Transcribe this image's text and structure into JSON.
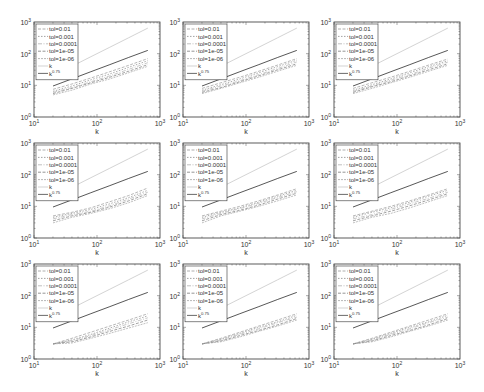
{
  "figure": {
    "layout": {
      "rows": 3,
      "cols": 3
    },
    "colors": {
      "axis": "#333333",
      "legend_border": "#333333",
      "k_line": "#c8c8c8",
      "k075_line": "#444444",
      "tol_lines": [
        "#9a9a9a",
        "#8a8a8a",
        "#b0b0b0",
        "#7a7a7a",
        "#a5a5a5"
      ]
    }
  },
  "chart_data": [
    {
      "type": "line",
      "panel": "row1-col1",
      "xscale": "log",
      "yscale": "log",
      "xlim": [
        10,
        1000
      ],
      "ylim": [
        1,
        1000
      ],
      "xlabel": "k",
      "ylabel": "",
      "xticks": [
        "10^1",
        "10^2",
        "10^3"
      ],
      "yticks": [
        "10^0",
        "10^1",
        "10^2",
        "10^3"
      ],
      "x": [
        20,
        40,
        80,
        160,
        320,
        640
      ],
      "legend": [
        "tol=0.01",
        "tol=0.001",
        "tol=0.0001",
        "tol=1e-05",
        "tol=1e-06",
        "k",
        "k^{0.75}"
      ],
      "legend_position": "upper left",
      "series": [
        {
          "name": "tol=0.01",
          "values": [
            7.5,
            11,
            17,
            27,
            43,
            70
          ]
        },
        {
          "name": "tol=0.001",
          "values": [
            6.5,
            9.5,
            15,
            23,
            37,
            60
          ]
        },
        {
          "name": "tol=0.0001",
          "values": [
            6,
            8.5,
            13,
            20,
            32,
            52
          ]
        },
        {
          "name": "tol=1e-05",
          "values": [
            5.5,
            8,
            12,
            18,
            28,
            45
          ]
        },
        {
          "name": "tol=1e-06",
          "values": [
            5,
            7,
            11,
            16,
            25,
            40
          ]
        },
        {
          "name": "k",
          "values": [
            20,
            40,
            80,
            160,
            320,
            640
          ]
        },
        {
          "name": "k^{0.75}",
          "values": [
            9.5,
            16,
            27,
            45,
            76,
            127
          ]
        }
      ]
    },
    {
      "type": "line",
      "panel": "row1-col2",
      "xscale": "log",
      "yscale": "log",
      "xlim": [
        10,
        1000
      ],
      "ylim": [
        1,
        1000
      ],
      "xlabel": "k",
      "ylabel": "",
      "xticks": [
        "10^1",
        "10^2",
        "10^3"
      ],
      "yticks": [
        "10^0",
        "10^1",
        "10^2",
        "10^3"
      ],
      "x": [
        20,
        40,
        80,
        160,
        320,
        640
      ],
      "legend": [
        "tol=0.01",
        "tol=0.001",
        "tol=0.0001",
        "tol=1e-05",
        "tol=1e-06",
        "k",
        "k^{0.75}"
      ],
      "legend_position": "upper left",
      "series": [
        {
          "name": "tol=0.01",
          "values": [
            8,
            12,
            18,
            28,
            44,
            70
          ]
        },
        {
          "name": "tol=0.001",
          "values": [
            7,
            10.5,
            16,
            25,
            39,
            62
          ]
        },
        {
          "name": "tol=0.0001",
          "values": [
            6.5,
            9.5,
            14,
            22,
            34,
            55
          ]
        },
        {
          "name": "tol=1e-05",
          "values": [
            6,
            8.5,
            13,
            20,
            31,
            48
          ]
        },
        {
          "name": "tol=1e-06",
          "values": [
            5.5,
            8,
            12,
            18,
            28,
            43
          ]
        },
        {
          "name": "k",
          "values": [
            20,
            40,
            80,
            160,
            320,
            640
          ]
        },
        {
          "name": "k^{0.75}",
          "values": [
            9.5,
            16,
            27,
            45,
            76,
            127
          ]
        }
      ]
    },
    {
      "type": "line",
      "panel": "row1-col3",
      "xscale": "log",
      "yscale": "log",
      "xlim": [
        10,
        1000
      ],
      "ylim": [
        1,
        1000
      ],
      "xlabel": "k",
      "ylabel": "",
      "xticks": [
        "10^1",
        "10^2",
        "10^3"
      ],
      "yticks": [
        "10^0",
        "10^1",
        "10^2",
        "10^3"
      ],
      "x": [
        20,
        40,
        80,
        160,
        320,
        640
      ],
      "legend": [
        "tol=0.01",
        "tol=0.001",
        "tol=0.0001",
        "tol=1e-05",
        "tol=1e-06",
        "k",
        "k^{0.75}"
      ],
      "legend_position": "upper left",
      "series": [
        {
          "name": "tol=0.01",
          "values": [
            8,
            12,
            18,
            28,
            44,
            68
          ]
        },
        {
          "name": "tol=0.001",
          "values": [
            7,
            10.5,
            16,
            25,
            39,
            60
          ]
        },
        {
          "name": "tol=0.0001",
          "values": [
            6.5,
            9.5,
            14.5,
            22,
            35,
            54
          ]
        },
        {
          "name": "tol=1e-05",
          "values": [
            6,
            9,
            13,
            20,
            31,
            48
          ]
        },
        {
          "name": "tol=1e-06",
          "values": [
            5.5,
            8,
            12,
            18,
            28,
            43
          ]
        },
        {
          "name": "k",
          "values": [
            20,
            40,
            80,
            160,
            320,
            640
          ]
        },
        {
          "name": "k^{0.75}",
          "values": [
            9.5,
            16,
            27,
            45,
            76,
            127
          ]
        }
      ]
    },
    {
      "type": "line",
      "panel": "row2-col1",
      "xscale": "log",
      "yscale": "log",
      "xlim": [
        10,
        1000
      ],
      "ylim": [
        1,
        1000
      ],
      "xlabel": "k",
      "ylabel": "",
      "xticks": [
        "10^1",
        "10^2",
        "10^3"
      ],
      "yticks": [
        "10^0",
        "10^1",
        "10^2",
        "10^3"
      ],
      "x": [
        20,
        40,
        80,
        160,
        320,
        640
      ],
      "legend": [
        "tol=0.01",
        "tol=0.001",
        "tol=0.0001",
        "tol=1e-05",
        "tol=1e-06",
        "k",
        "k^{0.75}"
      ],
      "legend_position": "upper left",
      "series": [
        {
          "name": "tol=0.01",
          "values": [
            5,
            6.5,
            9,
            14,
            22,
            38
          ]
        },
        {
          "name": "tol=0.001",
          "values": [
            4.5,
            6,
            8,
            12,
            19,
            32
          ]
        },
        {
          "name": "tol=0.0001",
          "values": [
            4,
            5.5,
            7,
            10.5,
            17,
            28
          ]
        },
        {
          "name": "tol=1e-05",
          "values": [
            3.5,
            5,
            6.5,
            9.5,
            15,
            25
          ]
        },
        {
          "name": "tol=1e-06",
          "values": [
            3,
            4.5,
            6,
            8.5,
            13,
            22
          ]
        },
        {
          "name": "k",
          "values": [
            20,
            40,
            80,
            160,
            320,
            640
          ]
        },
        {
          "name": "k^{0.75}",
          "values": [
            9.5,
            16,
            27,
            45,
            76,
            127
          ]
        }
      ]
    },
    {
      "type": "line",
      "panel": "row2-col2",
      "xscale": "log",
      "yscale": "log",
      "xlim": [
        10,
        1000
      ],
      "ylim": [
        1,
        1000
      ],
      "xlabel": "k",
      "ylabel": "",
      "xticks": [
        "10^1",
        "10^2",
        "10^3"
      ],
      "yticks": [
        "10^0",
        "10^1",
        "10^2",
        "10^3"
      ],
      "x": [
        20,
        40,
        80,
        160,
        320,
        640
      ],
      "legend": [
        "tol=0.01",
        "tol=0.001",
        "tol=0.0001",
        "tol=1e-05",
        "tol=1e-06",
        "k",
        "k^{0.75}"
      ],
      "legend_position": "upper left",
      "series": [
        {
          "name": "tol=0.01",
          "values": [
            5,
            7,
            10,
            15,
            23,
            36
          ]
        },
        {
          "name": "tol=0.001",
          "values": [
            4.5,
            6.5,
            9,
            13.5,
            21,
            32
          ]
        },
        {
          "name": "tol=0.0001",
          "values": [
            4,
            6,
            8.5,
            12.5,
            19,
            29
          ]
        },
        {
          "name": "tol=1e-05",
          "values": [
            3.5,
            5.5,
            7.5,
            11,
            17,
            26
          ]
        },
        {
          "name": "tol=1e-06",
          "values": [
            3,
            5,
            7,
            10,
            15,
            23
          ]
        },
        {
          "name": "k",
          "values": [
            20,
            40,
            80,
            160,
            320,
            640
          ]
        },
        {
          "name": "k^{0.75}",
          "values": [
            9.5,
            16,
            27,
            45,
            76,
            127
          ]
        }
      ]
    },
    {
      "type": "line",
      "panel": "row2-col3",
      "xscale": "log",
      "yscale": "log",
      "xlim": [
        10,
        1000
      ],
      "ylim": [
        1,
        1000
      ],
      "xlabel": "k",
      "ylabel": "",
      "xticks": [
        "10^1",
        "10^2",
        "10^3"
      ],
      "yticks": [
        "10^0",
        "10^1",
        "10^2",
        "10^3"
      ],
      "x": [
        20,
        40,
        80,
        160,
        320,
        640
      ],
      "legend": [
        "tol=0.01",
        "tol=0.001",
        "tol=0.0001",
        "tol=1e-05",
        "tol=1e-06",
        "k",
        "k^{0.75}"
      ],
      "legend_position": "upper left",
      "series": [
        {
          "name": "tol=0.01",
          "values": [
            5,
            7,
            10,
            15,
            23,
            36
          ]
        },
        {
          "name": "tol=0.001",
          "values": [
            4.5,
            6.5,
            9,
            13.5,
            21,
            32
          ]
        },
        {
          "name": "tol=0.0001",
          "values": [
            4,
            5.5,
            8,
            12,
            18,
            28
          ]
        },
        {
          "name": "tol=1e-05",
          "values": [
            3.5,
            5,
            7,
            10.5,
            16,
            25
          ]
        },
        {
          "name": "tol=1e-06",
          "values": [
            3,
            4.5,
            6,
            9,
            14,
            22
          ]
        },
        {
          "name": "k",
          "values": [
            20,
            40,
            80,
            160,
            320,
            640
          ]
        },
        {
          "name": "k^{0.75}",
          "values": [
            9.5,
            16,
            27,
            45,
            76,
            127
          ]
        }
      ]
    },
    {
      "type": "line",
      "panel": "row3-col1",
      "xscale": "log",
      "yscale": "log",
      "xlim": [
        10,
        1000
      ],
      "ylim": [
        1,
        1000
      ],
      "xlabel": "k",
      "ylabel": "",
      "xticks": [
        "10^1",
        "10^2",
        "10^3"
      ],
      "yticks": [
        "10^0",
        "10^1",
        "10^2",
        "10^3"
      ],
      "x": [
        20,
        40,
        80,
        160,
        320,
        640
      ],
      "legend": [
        "tol=0.01",
        "tol=0.001",
        "tol=0.0001",
        "tol=1e-05",
        "tol=1e-06",
        "k",
        "k^{0.75}"
      ],
      "legend_position": "upper left",
      "series": [
        {
          "name": "tol=0.01",
          "values": [
            3,
            4.5,
            7,
            11,
            17,
            27
          ]
        },
        {
          "name": "tol=0.001",
          "values": [
            3,
            4,
            6,
            9.5,
            15,
            23
          ]
        },
        {
          "name": "tol=0.0001",
          "values": [
            3,
            3.8,
            5.5,
            8.5,
            13,
            20
          ]
        },
        {
          "name": "tol=1e-05",
          "values": [
            3,
            3.5,
            5,
            7.5,
            11,
            17
          ]
        },
        {
          "name": "tol=1e-06",
          "values": [
            3,
            3.2,
            4.5,
            6.5,
            9.5,
            14
          ]
        },
        {
          "name": "k",
          "values": [
            20,
            40,
            80,
            160,
            320,
            640
          ]
        },
        {
          "name": "k^{0.75}",
          "values": [
            9.5,
            16,
            27,
            45,
            76,
            127
          ]
        }
      ]
    },
    {
      "type": "line",
      "panel": "row3-col2",
      "xscale": "log",
      "yscale": "log",
      "xlim": [
        10,
        1000
      ],
      "ylim": [
        1,
        1000
      ],
      "xlabel": "k",
      "ylabel": "",
      "xticks": [
        "10^1",
        "10^2",
        "10^3"
      ],
      "yticks": [
        "10^0",
        "10^1",
        "10^2",
        "10^3"
      ],
      "x": [
        20,
        40,
        80,
        160,
        320,
        640
      ],
      "legend": [
        "tol=0.01",
        "tol=0.001",
        "tol=0.0001",
        "tol=1e-05",
        "tol=1e-06",
        "k",
        "k^{0.75}"
      ],
      "legend_position": "upper left",
      "series": [
        {
          "name": "tol=0.01",
          "values": [
            3,
            4.5,
            7,
            11,
            17,
            27
          ]
        },
        {
          "name": "tol=0.001",
          "values": [
            3,
            4.2,
            6.5,
            10,
            15,
            24
          ]
        },
        {
          "name": "tol=0.0001",
          "values": [
            3,
            4,
            6,
            9,
            14,
            21
          ]
        },
        {
          "name": "tol=1e-05",
          "values": [
            3,
            3.7,
            5.5,
            8,
            12,
            19
          ]
        },
        {
          "name": "tol=1e-06",
          "values": [
            3,
            3.5,
            5,
            7.5,
            11,
            17
          ]
        },
        {
          "name": "k",
          "values": [
            20,
            40,
            80,
            160,
            320,
            640
          ]
        },
        {
          "name": "k^{0.75}",
          "values": [
            9.5,
            16,
            27,
            45,
            76,
            127
          ]
        }
      ]
    },
    {
      "type": "line",
      "panel": "row3-col3",
      "xscale": "log",
      "yscale": "log",
      "xlim": [
        10,
        1000
      ],
      "ylim": [
        1,
        1000
      ],
      "xlabel": "k",
      "ylabel": "",
      "xticks": [
        "10^1",
        "10^2",
        "10^3"
      ],
      "yticks": [
        "10^0",
        "10^1",
        "10^2",
        "10^3"
      ],
      "x": [
        20,
        40,
        80,
        160,
        320,
        640
      ],
      "legend": [
        "tol=0.01",
        "tol=0.001",
        "tol=0.0001",
        "tol=1e-05",
        "tol=1e-06",
        "k",
        "k^{0.75}"
      ],
      "legend_position": "upper left",
      "series": [
        {
          "name": "tol=0.01",
          "values": [
            3,
            4.5,
            7,
            11,
            17,
            27
          ]
        },
        {
          "name": "tol=0.001",
          "values": [
            3,
            4.2,
            6.5,
            10,
            15,
            24
          ]
        },
        {
          "name": "tol=0.0001",
          "values": [
            3,
            4,
            6,
            9,
            14,
            21
          ]
        },
        {
          "name": "tol=1e-05",
          "values": [
            3,
            3.7,
            5.5,
            8,
            12,
            19
          ]
        },
        {
          "name": "tol=1e-06",
          "values": [
            3,
            3.5,
            5,
            7.5,
            11,
            17
          ]
        },
        {
          "name": "k",
          "values": [
            20,
            40,
            80,
            160,
            320,
            640
          ]
        },
        {
          "name": "k^{0.75}",
          "values": [
            9.5,
            16,
            27,
            45,
            76,
            127
          ]
        }
      ]
    }
  ]
}
